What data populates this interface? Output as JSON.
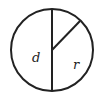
{
  "diagram": {
    "shape": "circle",
    "labels": {
      "diameter": "d",
      "radius": "r"
    },
    "colors": {
      "stroke": "#222222",
      "background": "#ffffff"
    }
  }
}
